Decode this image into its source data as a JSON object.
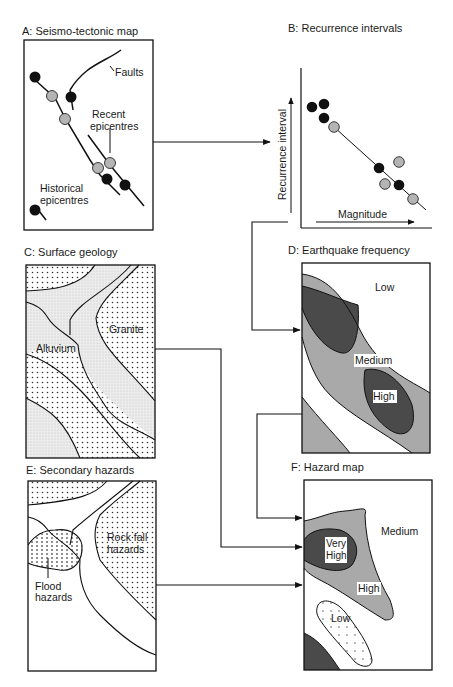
{
  "panels": {
    "a": {
      "title": "A: Seismo-tectonic map",
      "labels": {
        "faults": "Faults",
        "recent_1": "Recent",
        "recent_2": "epicentres",
        "historical_1": "Historical",
        "historical_2": "epicentres"
      }
    },
    "b": {
      "title": "B: Recurrence intervals",
      "y_axis": "Recurrence interval",
      "x_axis": "Magnitude"
    },
    "c": {
      "title": "C: Surface geology",
      "labels": {
        "granite": "Granite",
        "alluvium": "Alluvium"
      }
    },
    "d": {
      "title": "D: Earthquake frequency",
      "labels": {
        "low": "Low",
        "medium": "Medium",
        "high": "High"
      }
    },
    "e": {
      "title": "E: Secondary hazards",
      "labels": {
        "rockfall_1": "Rock fall",
        "rockfall_2": "hazards",
        "flood_1": "Flood",
        "flood_2": "hazards"
      }
    },
    "f": {
      "title": "F: Hazard map",
      "labels": {
        "medium": "Medium",
        "very_1": "Very",
        "very_2": "High",
        "high": "High",
        "low": "Low"
      }
    }
  },
  "colors": {
    "historical_epicentre": "#111111",
    "recent_epicentre": "#b4b4b4",
    "medium_zone": "#a9a9a9",
    "high_zone": "#4a4a4a",
    "alluvium": "#ececec"
  }
}
